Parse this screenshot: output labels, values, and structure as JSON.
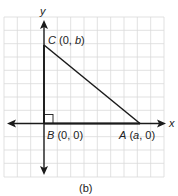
{
  "figure": {
    "caption": "(b)",
    "axes": {
      "x_label": "x",
      "y_label": "y"
    },
    "grid": {
      "cells_x": 12,
      "cells_y": 12,
      "color": "#d9d9d9"
    },
    "triangle": {
      "vertices": [
        {
          "name": "C",
          "coords": "(0, b)",
          "label_letter": "C",
          "label_open": " (0, ",
          "label_var": "b",
          "label_close": ")"
        },
        {
          "name": "B",
          "coords": "(0, 0)",
          "label_letter": "B",
          "label_rest": " (0, 0)"
        },
        {
          "name": "A",
          "coords": "(a, 0)",
          "label_letter": "A",
          "label_open": " (",
          "label_var": "a",
          "label_close": ", 0)"
        }
      ],
      "right_angle_at": "B",
      "stroke_color": "#1a1a1a"
    }
  }
}
